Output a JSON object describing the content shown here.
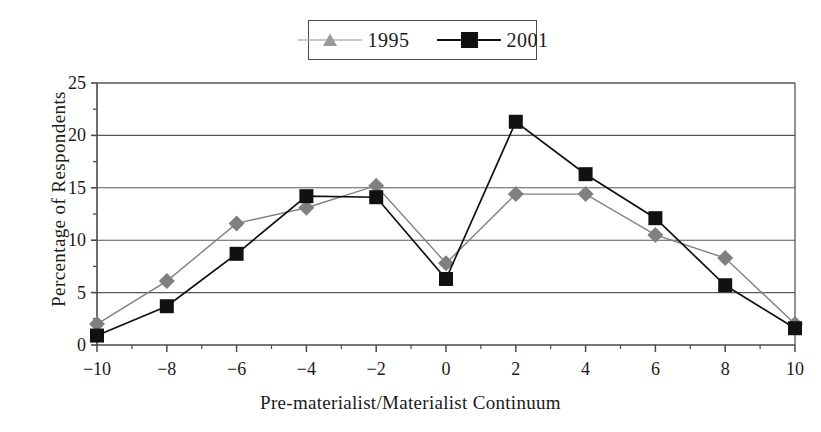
{
  "chart_data": {
    "type": "line",
    "title": "",
    "xlabel": "Pre-materialist/Materialist Continuum",
    "ylabel": "Percentage of Respondents",
    "x": [
      -10,
      -8,
      -6,
      -4,
      -2,
      0,
      2,
      4,
      6,
      8,
      10
    ],
    "xtick_labels": [
      "−10",
      "−8",
      "−6",
      "−4",
      "−2",
      "0",
      "2",
      "4",
      "6",
      "8",
      "10"
    ],
    "ytick_labels": [
      "0",
      "5",
      "10",
      "15",
      "20",
      "25"
    ],
    "yticks": [
      0,
      5,
      10,
      15,
      20,
      25
    ],
    "xlim": [
      -10,
      10
    ],
    "ylim": [
      0,
      25
    ],
    "grid": "horizontal",
    "legend_position": "top-center",
    "series": [
      {
        "name": "1995",
        "color": "#808080",
        "marker": "diamond",
        "legend_marker": "triangle",
        "values": [
          2.0,
          6.1,
          11.6,
          13.1,
          15.2,
          7.8,
          14.4,
          14.4,
          10.5,
          8.3,
          2.0
        ]
      },
      {
        "name": "2001",
        "color": "#111111",
        "marker": "square",
        "legend_marker": "square",
        "values": [
          0.9,
          3.7,
          8.7,
          14.2,
          14.1,
          6.3,
          21.3,
          16.3,
          12.1,
          5.7,
          1.6
        ]
      }
    ]
  },
  "legend": {
    "entries": [
      {
        "label": "1995"
      },
      {
        "label": "2001"
      }
    ]
  },
  "colors": {
    "series_1995": "#808080",
    "series_2001": "#111111",
    "axis": "#4a4a4a",
    "grid": "#595959",
    "background": "#ffffff"
  }
}
